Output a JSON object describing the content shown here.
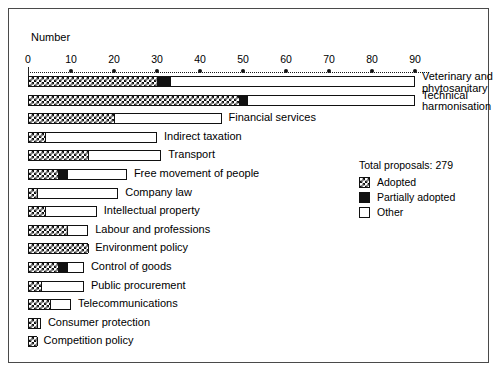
{
  "chart": {
    "type": "bar",
    "axis_title": "Number",
    "ticks": [
      0,
      10,
      20,
      30,
      40,
      50,
      60,
      70,
      80,
      90
    ],
    "xlim": [
      0,
      90
    ]
  },
  "legend": {
    "total_label": "Total proposals: 279",
    "items": [
      {
        "label": "Adopted",
        "swatch": "adopted"
      },
      {
        "label": "Partially adopted",
        "swatch": "partial"
      },
      {
        "label": "Other",
        "swatch": "other"
      }
    ]
  },
  "chart_data": {
    "type": "bar",
    "orientation": "horizontal",
    "stacked": true,
    "title": "",
    "xlabel": "Number",
    "ylabel": "",
    "xlim": [
      0,
      90
    ],
    "grid": false,
    "legend_position": "right",
    "total_proposals": 279,
    "categories": [
      "Veterinary and phytosanitary",
      "Technical harmonisation",
      "Financial services",
      "Indirect taxation",
      "Transport",
      "Free movement of people",
      "Company law",
      "Intellectual property",
      "Labour and professions",
      "Environment policy",
      "Control of goods",
      "Public procurement",
      "Telecommunications",
      "Consumer protection",
      "Competition policy"
    ],
    "series": [
      {
        "name": "Adopted",
        "values": [
          30,
          49,
          20,
          4,
          14,
          7,
          2,
          4,
          9,
          14,
          7,
          3,
          5,
          2,
          2
        ]
      },
      {
        "name": "Partially adopted",
        "values": [
          3,
          2,
          0,
          0,
          0,
          2,
          0,
          0,
          0,
          0,
          2,
          0,
          0,
          0,
          0
        ]
      },
      {
        "name": "Other",
        "values": [
          57,
          39,
          25,
          26,
          17,
          14,
          19,
          12,
          5,
          0,
          4,
          10,
          5,
          1,
          0
        ]
      }
    ]
  },
  "rows": [
    {
      "label": "Veterinary and phytosanitary",
      "two_line": true,
      "adopted": 30,
      "partial": 3,
      "total": 90
    },
    {
      "label": "Technical harmonisation",
      "two_line": true,
      "adopted": 49,
      "partial": 2,
      "total": 90
    },
    {
      "label": "Financial services",
      "two_line": false,
      "adopted": 20,
      "partial": 0,
      "total": 45
    },
    {
      "label": "Indirect taxation",
      "two_line": false,
      "adopted": 4,
      "partial": 0,
      "total": 30
    },
    {
      "label": "Transport",
      "two_line": false,
      "adopted": 14,
      "partial": 0,
      "total": 31
    },
    {
      "label": "Free movement of people",
      "two_line": false,
      "adopted": 7,
      "partial": 2,
      "total": 23
    },
    {
      "label": "Company law",
      "two_line": false,
      "adopted": 2,
      "partial": 0,
      "total": 21
    },
    {
      "label": "Intellectual property",
      "two_line": false,
      "adopted": 4,
      "partial": 0,
      "total": 16
    },
    {
      "label": "Labour and professions",
      "two_line": false,
      "adopted": 9,
      "partial": 0,
      "total": 14
    },
    {
      "label": "Environment policy",
      "two_line": false,
      "adopted": 14,
      "partial": 0,
      "total": 14
    },
    {
      "label": "Control of goods",
      "two_line": false,
      "adopted": 7,
      "partial": 2,
      "total": 13
    },
    {
      "label": "Public procurement",
      "two_line": false,
      "adopted": 3,
      "partial": 0,
      "total": 13
    },
    {
      "label": "Telecommunications",
      "two_line": false,
      "adopted": 5,
      "partial": 0,
      "total": 10
    },
    {
      "label": "Consumer protection",
      "two_line": false,
      "adopted": 2,
      "partial": 0,
      "total": 3
    },
    {
      "label": "Competition policy",
      "two_line": false,
      "adopted": 2,
      "partial": 0,
      "total": 2
    }
  ]
}
